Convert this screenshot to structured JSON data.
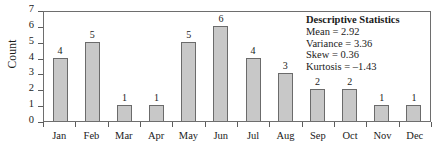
{
  "chart_data": {
    "type": "bar",
    "title": "",
    "xlabel": "",
    "ylabel": "Count",
    "categories": [
      "Jan",
      "Feb",
      "Mar",
      "Apr",
      "May",
      "Jun",
      "Jul",
      "Aug",
      "Sep",
      "Oct",
      "Nov",
      "Dec"
    ],
    "values": [
      4,
      5,
      1,
      1,
      5,
      6,
      4,
      3,
      2,
      2,
      1,
      1
    ],
    "data_labels": [
      "4",
      "5",
      "1",
      "1",
      "5",
      "6",
      "4",
      "3",
      "2",
      "2",
      "1",
      "1"
    ],
    "ylim": [
      0,
      7
    ],
    "ytick_labels": [
      "0",
      "1",
      "2",
      "3",
      "4",
      "5",
      "6",
      "7"
    ],
    "grid": false,
    "legend": "none",
    "bar_fill_color": "#c8c8c8",
    "bar_border_color": "#6b6b6b",
    "frame_color": "#6e6e6e"
  },
  "annotation": {
    "title": "Descriptive Statistics",
    "lines": [
      "Mean = 2.92",
      "Variance = 3.36",
      "Skew = 0.36",
      "Kurtosis = –1.43"
    ]
  }
}
